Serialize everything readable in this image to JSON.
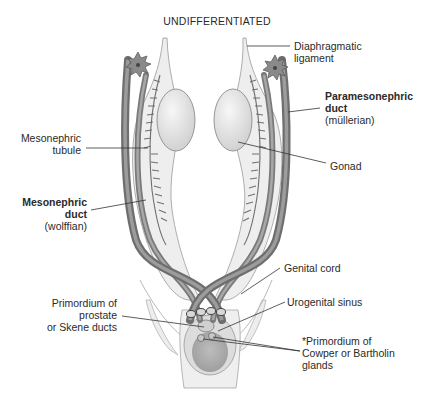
{
  "title": "UNDIFFERENTIATED",
  "colors": {
    "duct_dark": "#7d7d7d",
    "duct_mid": "#9a9a9a",
    "ligament_fill": "#ececec",
    "gonad_fill": "#e6e6e6",
    "sinus_dark": "#a9a9a9",
    "sinus_light": "#dadada",
    "leader_line": "#333333"
  },
  "labels": {
    "diaphragmatic_ligament": {
      "line1": "Diaphragmatic",
      "line2": "ligament"
    },
    "paramesonephric_duct": {
      "line1": "Paramesonephric",
      "line2": "duct",
      "line3": "(müllerian)"
    },
    "mesonephric_tubule": {
      "line1": "Mesonephric",
      "line2": "tubule"
    },
    "gonad": {
      "line1": "Gonad"
    },
    "mesonephric_duct": {
      "line1": "Mesonephric",
      "line2": "duct",
      "line3": "(wolffian)"
    },
    "genital_cord": {
      "line1": "Genital cord"
    },
    "urogenital_sinus": {
      "line1": "Urogenital sinus"
    },
    "primordium_prostate": {
      "line1": "Primordium of",
      "line2": "prostate",
      "line3": "or Skene ducts"
    },
    "primordium_cowper": {
      "line1": "*Primordium of",
      "line2": "Cowper or Bartholin",
      "line3": "glands"
    }
  }
}
